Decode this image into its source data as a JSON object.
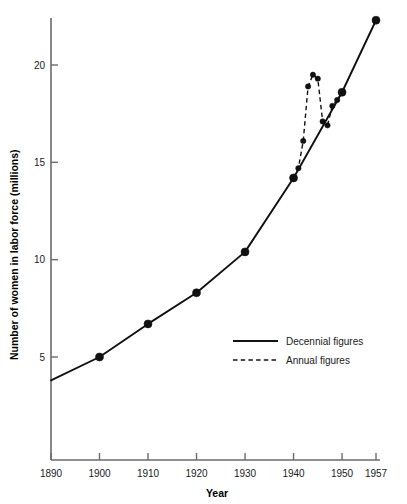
{
  "chart_data": {
    "type": "line",
    "title": "",
    "xlabel": "Year",
    "ylabel": "Number of women in labor force (millions)",
    "xlim": [
      1890,
      1957
    ],
    "ylim": [
      0,
      23
    ],
    "grid": false,
    "legend_position": "inside-lower-right",
    "xticks": [
      1890,
      1900,
      1910,
      1920,
      1930,
      1940,
      1950,
      1957
    ],
    "xtick_labels": [
      "1890",
      "1900",
      "1910",
      "1920",
      "1930",
      "1940",
      "1950",
      "1957"
    ],
    "yticks": [
      5,
      10,
      15,
      20
    ],
    "ytick_labels": [
      "5",
      "10",
      "15",
      "20"
    ],
    "series": [
      {
        "name": "Decennial figures",
        "style": "solid",
        "marker": "filled-circle",
        "color": "#111111",
        "x": [
          1890,
          1900,
          1910,
          1920,
          1930,
          1940,
          1950,
          1957
        ],
        "values": [
          3.8,
          5.0,
          6.7,
          8.3,
          10.4,
          14.2,
          18.6,
          22.3
        ],
        "markers_shown": [
          false,
          true,
          true,
          true,
          true,
          true,
          true,
          true
        ]
      },
      {
        "name": "Annual figures",
        "style": "dashed",
        "marker": "filled-circle",
        "color": "#111111",
        "x": [
          1940,
          1941,
          1942,
          1943,
          1944,
          1945,
          1946,
          1947,
          1948,
          1949,
          1950
        ],
        "values": [
          14.2,
          14.7,
          16.1,
          18.9,
          19.5,
          19.3,
          17.1,
          16.9,
          17.9,
          18.2,
          18.6
        ]
      }
    ]
  },
  "legend": {
    "entries": [
      {
        "label": "Decennial figures",
        "style": "solid"
      },
      {
        "label": "Annual figures",
        "style": "dashed"
      }
    ]
  },
  "axes": {
    "x_title": "Year",
    "y_title": "Number of women in labor force (millions)"
  }
}
